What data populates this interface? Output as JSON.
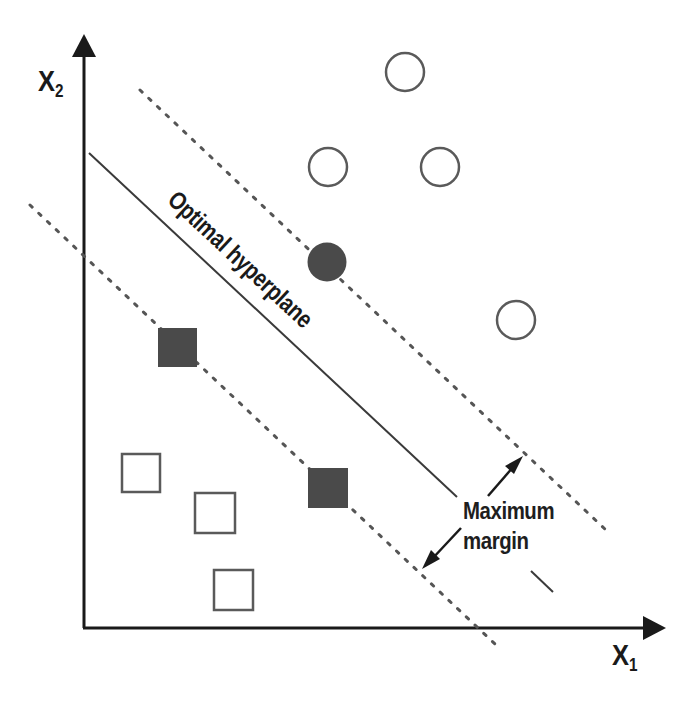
{
  "diagram": {
    "axes": {
      "x_label": "X",
      "x_subscript": "1",
      "y_label": "X",
      "y_subscript": "2"
    },
    "annotations": {
      "hyperplane": "Optimal hyperplane",
      "margin_line1": "Maximum",
      "margin_line2": "margin"
    },
    "colors": {
      "axis": "#1a1a1a",
      "hyperplane": "#3a3a3a",
      "margin_lines": "#555555",
      "filled_marker": "#4a4a4a",
      "open_marker_stroke": "#5a5a5a",
      "background": "#ffffff"
    },
    "classes": [
      {
        "name": "circles",
        "shape": "circle",
        "points": [
          {
            "x": 405,
            "y": 72,
            "support_vector": false
          },
          {
            "x": 328,
            "y": 167,
            "support_vector": false
          },
          {
            "x": 440,
            "y": 167,
            "support_vector": false
          },
          {
            "x": 516,
            "y": 320,
            "support_vector": false
          },
          {
            "x": 327,
            "y": 262,
            "support_vector": true
          }
        ]
      },
      {
        "name": "squares",
        "shape": "square",
        "points": [
          {
            "x": 178,
            "y": 348,
            "support_vector": true
          },
          {
            "x": 328,
            "y": 488,
            "support_vector": true
          },
          {
            "x": 141,
            "y": 473,
            "support_vector": false
          },
          {
            "x": 215,
            "y": 513,
            "support_vector": false
          },
          {
            "x": 233,
            "y": 590,
            "support_vector": false
          }
        ]
      }
    ]
  }
}
